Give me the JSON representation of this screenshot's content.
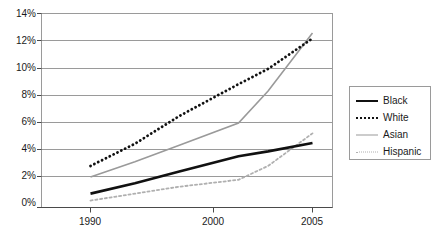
{
  "chart_data": {
    "type": "line",
    "title": "",
    "subtitle": "",
    "xlabel": "",
    "ylabel": "",
    "x": [
      1990,
      2000,
      2005
    ],
    "xtick_labels": [
      "1990",
      "2000",
      "2005"
    ],
    "ytick_labels": [
      "0%",
      "2%",
      "4%",
      "6%",
      "8%",
      "10%",
      "12%",
      "14%"
    ],
    "ytick_values": [
      0,
      2,
      4,
      6,
      8,
      10,
      12,
      14
    ],
    "ylim": [
      0,
      14
    ],
    "xlim": [
      1990,
      2005
    ],
    "grid": "horizontal",
    "legend_position": "right",
    "units": "percent",
    "series": [
      {
        "name": "Black",
        "style": "solid-thick-dark",
        "color": "#111111",
        "x": [
          1990,
          1993,
          1996,
          2000,
          2002,
          2005
        ],
        "values": [
          1.0,
          1.75,
          2.6,
          3.7,
          4.05,
          4.65
        ]
      },
      {
        "name": "White",
        "style": "dotted-thick-dark",
        "color": "#111111",
        "x": [
          1990,
          1993,
          1996,
          2000,
          2002,
          2005
        ],
        "values": [
          3.0,
          4.6,
          6.6,
          8.9,
          10.0,
          12.2
        ]
      },
      {
        "name": "Asian",
        "style": "solid-thin-gray",
        "color": "#9a9a9a",
        "x": [
          1990,
          1993,
          1996,
          2000,
          2002,
          2005
        ],
        "values": [
          2.2,
          3.3,
          4.5,
          6.1,
          8.4,
          12.6
        ]
      },
      {
        "name": "Hispanic",
        "style": "dotted-thin-gray",
        "color": "#b0b0b0",
        "x": [
          1990,
          1993,
          1996,
          2000,
          2002,
          2005
        ],
        "values": [
          0.5,
          1.0,
          1.5,
          2.0,
          3.0,
          5.35
        ]
      }
    ],
    "annotations": [
      "Asian line crosses above White line shortly before 2005"
    ]
  },
  "legend": {
    "items": [
      {
        "label": "Black"
      },
      {
        "label": "White"
      },
      {
        "label": "Asian"
      },
      {
        "label": "Hispanic"
      }
    ]
  }
}
